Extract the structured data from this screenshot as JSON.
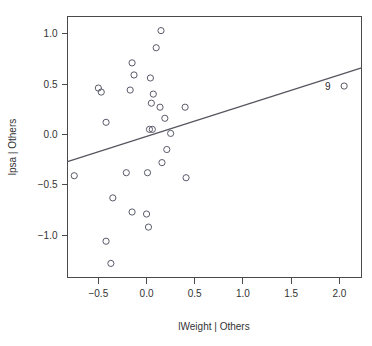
{
  "chart_data": {
    "type": "scatter",
    "title": "",
    "subtitle": "",
    "xlabel": "lWeight | Others",
    "ylabel": "lpsa | Others",
    "xlim": [
      -0.82,
      2.23
    ],
    "ylim": [
      -1.42,
      1.17
    ],
    "xticks": [
      -0.5,
      0.0,
      0.5,
      1.0,
      1.5,
      2.0
    ],
    "xticklabels": [
      "-0.5",
      "0.0",
      "0.5",
      "1.0",
      "1.5",
      "2.0"
    ],
    "yticks": [
      1.0,
      0.5,
      0.0,
      -0.5,
      -1.0
    ],
    "yticklabels": [
      "1.0",
      "0.5",
      "0.0",
      "-0.5",
      "-1.0"
    ],
    "grid": false,
    "legend": null,
    "marker": "open-circle",
    "points": [
      {
        "x": 0.15,
        "y": 1.03
      },
      {
        "x": 0.1,
        "y": 0.86
      },
      {
        "x": -0.15,
        "y": 0.71
      },
      {
        "x": -0.13,
        "y": 0.59
      },
      {
        "x": 0.04,
        "y": 0.56
      },
      {
        "x": -0.5,
        "y": 0.46
      },
      {
        "x": -0.47,
        "y": 0.42
      },
      {
        "x": -0.17,
        "y": 0.44
      },
      {
        "x": 2.05,
        "y": 0.48
      },
      {
        "x": 0.07,
        "y": 0.4
      },
      {
        "x": 0.05,
        "y": 0.31
      },
      {
        "x": 0.14,
        "y": 0.27
      },
      {
        "x": 0.4,
        "y": 0.27
      },
      {
        "x": 0.19,
        "y": 0.16
      },
      {
        "x": -0.42,
        "y": 0.12
      },
      {
        "x": 0.03,
        "y": 0.05
      },
      {
        "x": 0.06,
        "y": 0.05
      },
      {
        "x": 0.25,
        "y": 0.01
      },
      {
        "x": 0.21,
        "y": -0.15
      },
      {
        "x": 0.16,
        "y": -0.28
      },
      {
        "x": -0.75,
        "y": -0.41
      },
      {
        "x": -0.21,
        "y": -0.38
      },
      {
        "x": 0.01,
        "y": -0.38
      },
      {
        "x": 0.41,
        "y": -0.43
      },
      {
        "x": -0.35,
        "y": -0.63
      },
      {
        "x": -0.15,
        "y": -0.77
      },
      {
        "x": 0.0,
        "y": -0.79
      },
      {
        "x": 0.02,
        "y": -0.92
      },
      {
        "x": -0.42,
        "y": -1.06
      },
      {
        "x": -0.37,
        "y": -1.28
      }
    ],
    "annotations": [
      {
        "text": "9",
        "x": 1.88,
        "y": 0.48,
        "for_point": {
          "x": 2.05,
          "y": 0.48
        }
      }
    ],
    "fit_line": {
      "type": "linear",
      "x_start": -0.82,
      "y_start": -0.27,
      "x_end": 2.23,
      "y_end": 0.66,
      "slope": 0.305,
      "intercept": -0.02
    },
    "colors": {
      "point_stroke": "#5a5a6a",
      "line": "#55555f",
      "axis": "#4a4a4a",
      "text": "#333333",
      "background": "#ffffff"
    }
  }
}
